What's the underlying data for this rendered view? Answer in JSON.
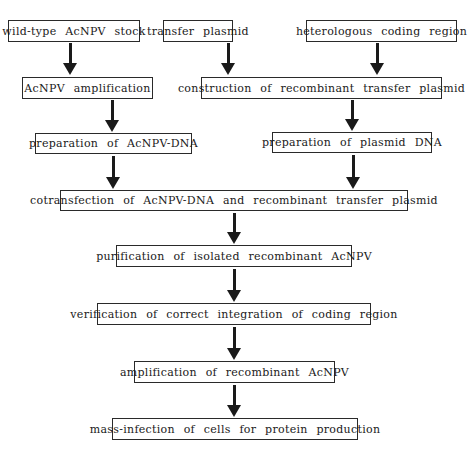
{
  "diagram": {
    "type": "flowchart",
    "nodes": [
      {
        "id": "n1",
        "label": "wild-type AcNPV stock"
      },
      {
        "id": "n2",
        "label": "transfer plasmid"
      },
      {
        "id": "n3",
        "label": "heterologous coding region"
      },
      {
        "id": "n4",
        "label": "AcNPV amplification"
      },
      {
        "id": "n5",
        "label": "construction of recombinant transfer plasmid"
      },
      {
        "id": "n6",
        "label": "preparation of AcNPV-DNA"
      },
      {
        "id": "n7",
        "label": "preparation of plasmid DNA"
      },
      {
        "id": "n8",
        "label": "cotransfection of AcNPV-DNA and recombinant transfer plasmid"
      },
      {
        "id": "n9",
        "label": "purification of isolated recombinant AcNPV"
      },
      {
        "id": "n10",
        "label": "verification of correct integration of coding region"
      },
      {
        "id": "n11",
        "label": "amplification of recombinant AcNPV"
      },
      {
        "id": "n12",
        "label": "mass-infection of cells for protein production"
      }
    ],
    "edges": [
      {
        "from": "n1",
        "to": "n4"
      },
      {
        "from": "n2",
        "to": "n5"
      },
      {
        "from": "n3",
        "to": "n5"
      },
      {
        "from": "n4",
        "to": "n6"
      },
      {
        "from": "n5",
        "to": "n7"
      },
      {
        "from": "n6",
        "to": "n8"
      },
      {
        "from": "n7",
        "to": "n8"
      },
      {
        "from": "n8",
        "to": "n9"
      },
      {
        "from": "n9",
        "to": "n10"
      },
      {
        "from": "n10",
        "to": "n11"
      },
      {
        "from": "n11",
        "to": "n12"
      }
    ]
  }
}
